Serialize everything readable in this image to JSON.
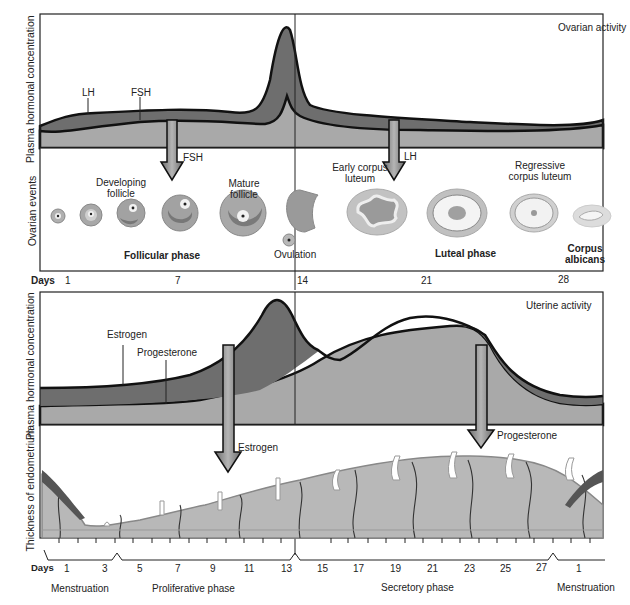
{
  "ovarian_panel": {
    "title": "Ovarian activity",
    "y_axis_hormone": "Plasma hormonal concentration",
    "y_axis_events": "Ovarian events",
    "curve_labels": {
      "lh": "LH",
      "fsh": "FSH"
    },
    "arrows": {
      "fsh": "FSH",
      "lh": "LH"
    },
    "event_labels": {
      "developing_follicle": "Developing follicle",
      "mature_follicle": "Mature follicle",
      "ovulation": "Ovulation",
      "early_corpus_luteum": "Early corpus luteum",
      "regressive_corpus_luteum": "Regressive corpus luteum",
      "corpus_albicans": "Corpus albicans"
    },
    "phases": {
      "follicular": "Follicular phase",
      "luteal": "Luteal phase"
    },
    "days_label": "Days",
    "day_ticks": [
      "1",
      "7",
      "14",
      "21",
      "28"
    ]
  },
  "uterine_panel": {
    "title": "Uterine activity",
    "y_axis_hormone": "Plasma hormonal concentration",
    "y_axis_thickness": "Thickness of endometrium",
    "curve_labels": {
      "estrogen": "Estrogen",
      "progesterone": "Progesterone"
    },
    "arrows": {
      "estrogen": "Estrogen",
      "progesterone": "Progesterone"
    },
    "days_label": "Days",
    "day_ticks": [
      "1",
      "3",
      "5",
      "7",
      "9",
      "11",
      "13",
      "15",
      "17",
      "19",
      "21",
      "23",
      "25",
      "27",
      "1"
    ],
    "phases": {
      "menstruation_start": "Menstruation",
      "proliferative": "Proliferative phase",
      "secretory": "Secretory phase",
      "menstruation_end": "Menstruation"
    }
  },
  "colors": {
    "dark_fill": "#6e6e6e",
    "light_fill": "#a9a9a9",
    "endometrium": "#b8b8b8",
    "outline": "#111111"
  }
}
